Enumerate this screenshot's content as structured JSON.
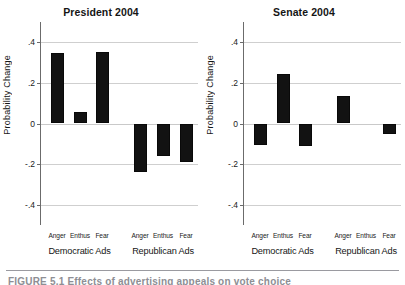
{
  "figure": {
    "caption_partial": "FIGURE 5.1   Effects of advertising appeals on vote choice"
  },
  "chart_data": [
    {
      "type": "bar",
      "title": "President 2004",
      "xlabel": "",
      "ylabel": "Probability Change",
      "ylim": [
        -0.5,
        0.5
      ],
      "yticks": [
        ".4",
        ".2",
        "0",
        "-.2",
        "-.4"
      ],
      "ytick_values": [
        0.4,
        0.2,
        0,
        -0.2,
        -0.4
      ],
      "grid": true,
      "legend": "none",
      "groups": [
        "Democratic Ads",
        "Republican Ads"
      ],
      "categories": [
        "Anger",
        "Enthus",
        "Fear",
        "Anger",
        "Enthus",
        "Fear"
      ],
      "values": [
        0.345,
        0.055,
        0.35,
        -0.24,
        -0.16,
        -0.19
      ]
    },
    {
      "type": "bar",
      "title": "Senate 2004",
      "xlabel": "",
      "ylabel": "Probability Change",
      "ylim": [
        -0.5,
        0.5
      ],
      "yticks": [
        ".4",
        ".2",
        "0",
        "-.2",
        "-.4"
      ],
      "ytick_values": [
        0.4,
        0.2,
        0,
        -0.2,
        -0.4
      ],
      "grid": true,
      "legend": "none",
      "groups": [
        "Democratic Ads",
        "Republican Ads"
      ],
      "categories": [
        "Anger",
        "Enthus",
        "Fear",
        "Anger",
        "Enthus",
        "Fear"
      ],
      "values": [
        -0.105,
        0.245,
        -0.11,
        0.135,
        0.0,
        -0.05
      ]
    }
  ],
  "colors": {
    "bar": "#121212",
    "grid": "#cfcfcf",
    "axis": "#6b6b6b",
    "text": "#151515",
    "rule": "#9a9aa0"
  }
}
